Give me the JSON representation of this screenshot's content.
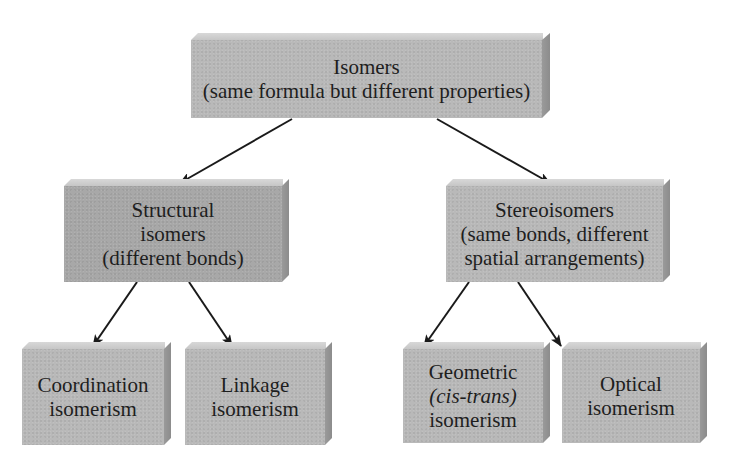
{
  "diagram": {
    "type": "hierarchy-tree",
    "colors": {
      "box_front": "#b9b9b9",
      "box_front_dark": "#a8a8a8",
      "box_top": "#d2d2d2",
      "box_side": "#919191",
      "text": "#1e1e1e",
      "arrow": "#1a1a1a",
      "background": "#ffffff"
    },
    "root": {
      "title": "Isomers",
      "subtitle": "(same formula but different properties)"
    },
    "level2": [
      {
        "lines": [
          "Structural",
          "isomers",
          "(different bonds)"
        ]
      },
      {
        "lines": [
          "Stereoisomers",
          "(same bonds, different",
          "spatial arrangements)"
        ]
      }
    ],
    "level3": [
      {
        "lines": [
          "Coordination",
          "isomerism"
        ]
      },
      {
        "lines": [
          "Linkage",
          "isomerism"
        ]
      },
      {
        "lines": [
          "Geometric",
          "(cis-trans)",
          "isomerism"
        ]
      },
      {
        "lines": [
          "Optical",
          "isomerism"
        ]
      }
    ],
    "edges": [
      {
        "from": "Isomers",
        "to": "Structural isomers"
      },
      {
        "from": "Isomers",
        "to": "Stereoisomers"
      },
      {
        "from": "Structural isomers",
        "to": "Coordination isomerism"
      },
      {
        "from": "Structural isomers",
        "to": "Linkage isomerism"
      },
      {
        "from": "Stereoisomers",
        "to": "Geometric (cis-trans) isomerism"
      },
      {
        "from": "Stereoisomers",
        "to": "Optical isomerism"
      }
    ]
  }
}
